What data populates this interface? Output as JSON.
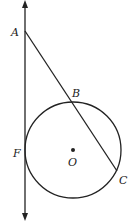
{
  "diagram": {
    "type": "geometry",
    "colors": {
      "stroke": "#222222",
      "background": "#ffffff"
    },
    "line": {
      "x": 25,
      "y_top": 2,
      "y_bottom": 219,
      "arrows": "both"
    },
    "circle": {
      "center": {
        "label": "O",
        "x": 73,
        "y": 150
      },
      "radius": 48
    },
    "points": [
      {
        "label": "A",
        "x": 25,
        "y": 31
      },
      {
        "label": "B",
        "x": 75,
        "y": 104
      },
      {
        "label": "C",
        "x": 117,
        "y": 171
      },
      {
        "label": "F",
        "x": 25,
        "y": 150
      },
      {
        "label": "O",
        "x": 73,
        "y": 150
      }
    ],
    "segments": [
      {
        "from": "A",
        "to": "C"
      }
    ],
    "labels": {
      "A": "A",
      "B": "B",
      "C": "C",
      "F": "F",
      "O": "O"
    }
  }
}
